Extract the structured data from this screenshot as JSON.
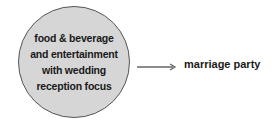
{
  "diagram": {
    "source_node": {
      "lines": [
        "food & beverage",
        "and entertainment",
        "with wedding",
        "reception focus"
      ],
      "fill": "#d6d6d6",
      "border": "#555555"
    },
    "arrow": {
      "direction": "right",
      "color": "#666666"
    },
    "target_label": "marriage party"
  }
}
